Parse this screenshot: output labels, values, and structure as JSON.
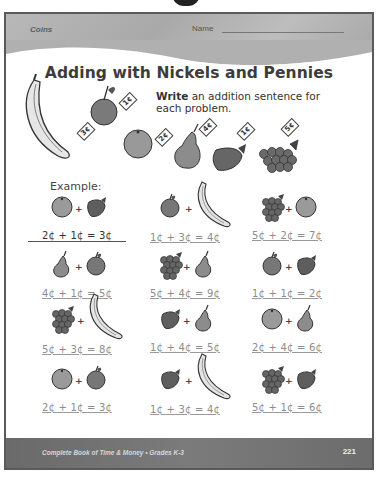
{
  "header": {
    "topic": "Coins",
    "name_label": "Name"
  },
  "title": "Adding with Nickels and Pennies",
  "instructions": {
    "bold": "Write",
    "rest": " an addition sentence for each problem."
  },
  "price_key": [
    {
      "fruit": "banana",
      "price": "3¢"
    },
    {
      "fruit": "apple",
      "price": "1¢"
    },
    {
      "fruit": "orange",
      "price": "2¢"
    },
    {
      "fruit": "pear",
      "price": "4¢"
    },
    {
      "fruit": "strawberry",
      "price": "1¢"
    },
    {
      "fruit": "grapes",
      "price": "5¢"
    }
  ],
  "example_label": "Example:",
  "problems": [
    {
      "a": "orange",
      "b": "strawberry",
      "answer": "2¢ + 1¢ = 3¢",
      "example": true
    },
    {
      "a": "apple",
      "b": "banana",
      "answer": "1¢ + 3¢ = 4¢"
    },
    {
      "a": "grapes",
      "b": "orange",
      "answer": "5¢ + 2¢ = 7¢"
    },
    {
      "a": "pear",
      "b": "apple",
      "answer": "4¢ + 1¢ = 5¢"
    },
    {
      "a": "grapes",
      "b": "pear",
      "answer": "5¢ + 4¢ = 9¢"
    },
    {
      "a": "apple",
      "b": "strawberry",
      "answer": "1¢ + 1¢ = 2¢"
    },
    {
      "a": "grapes",
      "b": "banana",
      "answer": "5¢ + 3¢ = 8¢"
    },
    {
      "a": "strawberry",
      "b": "pear",
      "answer": "1¢ + 4¢ = 5¢"
    },
    {
      "a": "orange",
      "b": "pear",
      "answer": "2¢ + 4¢ = 6¢"
    },
    {
      "a": "orange",
      "b": "apple",
      "answer": "2¢ + 1¢ = 3¢"
    },
    {
      "a": "strawberry",
      "b": "banana",
      "answer": "1¢ + 3¢ = 4¢"
    },
    {
      "a": "grapes",
      "b": "strawberry",
      "answer": "5¢ + 1¢ = 6¢"
    }
  ],
  "plus_sign": "+",
  "footer": {
    "book": "Complete Book of Time & Money  •  Grades K-3",
    "page_number": "221"
  },
  "colors": {
    "header_band": "#b3b3b3",
    "footer_band": "#727272",
    "border": "#5a5a5a",
    "answer_text": "#8c8c8c"
  }
}
